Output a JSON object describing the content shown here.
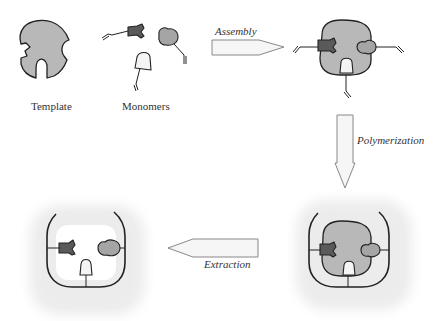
{
  "diagram": {
    "labels": {
      "template": "Template",
      "monomers": "Monomers"
    },
    "steps": [
      {
        "id": "assembly",
        "label": "Assembly",
        "direction": "right"
      },
      {
        "id": "polymerization",
        "label": "Polymerization",
        "direction": "down"
      },
      {
        "id": "extraction",
        "label": "Extraction",
        "direction": "left"
      }
    ],
    "stages": [
      {
        "id": "template",
        "description": "Template molecule with binding sites"
      },
      {
        "id": "monomers",
        "description": "Functional monomers (three types)"
      },
      {
        "id": "complex",
        "description": "Template-monomer complex"
      },
      {
        "id": "polymer",
        "description": "Template enclosed in polymer matrix"
      },
      {
        "id": "cavity",
        "description": "Imprinted cavity after template removal"
      }
    ],
    "colors": {
      "template_fill": "#b8b8b8",
      "monomer_dark": "#5a5a5a",
      "monomer_gray": "#a5a5a5",
      "monomer_light": "#f4f4f4",
      "outline": "#222222",
      "arrow_fill": "#f6f6f6",
      "arrow_stroke": "#888888",
      "matrix_shade": "#ececec"
    }
  }
}
